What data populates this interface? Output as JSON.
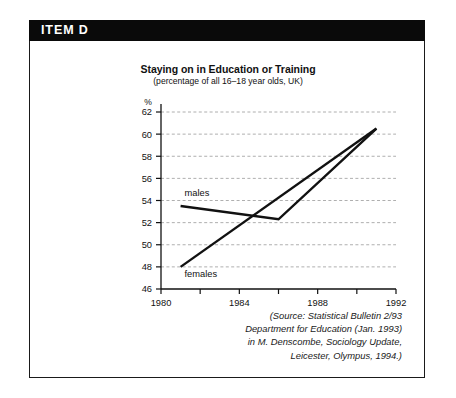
{
  "item": {
    "header_label": "ITEM D"
  },
  "chart_data": {
    "type": "line",
    "title": "Staying on in Education or Training",
    "subtitle": "(percentage of all 16–18 year olds, UK)",
    "xlabel": "",
    "ylabel": "%",
    "ylim": [
      46,
      62
    ],
    "xlim": [
      1980,
      1992
    ],
    "grid": true,
    "grid_style": "dashed-horizontal",
    "legend_position": "inline-labels",
    "y_ticks": [
      46,
      48,
      50,
      52,
      54,
      56,
      58,
      60,
      62
    ],
    "y_tick_labels": [
      "46",
      "48",
      "50",
      "52",
      "54",
      "56",
      "58",
      "60",
      "62"
    ],
    "x_ticks": [
      1980,
      1982,
      1984,
      1986,
      1988,
      1990,
      1992
    ],
    "x_tick_labels": [
      "1980",
      "",
      "1984",
      "",
      "1988",
      "",
      "1992"
    ],
    "series": [
      {
        "name": "males",
        "color": "#111111",
        "x": [
          1981,
          1986,
          1991
        ],
        "values": [
          53.5,
          52.3,
          60.5
        ]
      },
      {
        "name": "females",
        "color": "#111111",
        "x": [
          1981,
          1991
        ],
        "values": [
          48.0,
          60.5
        ]
      }
    ],
    "annotations": [
      {
        "text": "males",
        "x": 1981.2,
        "y": 54.4
      },
      {
        "text": "females",
        "x": 1981.2,
        "y": 47.1
      }
    ]
  },
  "source": {
    "line1": "(Source: Statistical Bulletin 2/93",
    "line2": "Department for Education (Jan. 1993)",
    "line3": "in M. Denscombe, Sociology Update,",
    "line4": "Leicester, Olympus, 1994.)"
  }
}
